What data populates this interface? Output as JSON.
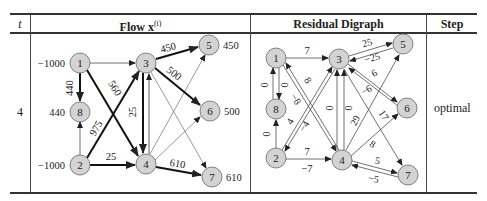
{
  "table": {
    "headers": {
      "t": "t",
      "flow": "Flow x",
      "flow_sup": "(t)",
      "residual": "Residual Digraph",
      "step": "Step"
    },
    "row": {
      "t": "4",
      "step": "optimal"
    }
  },
  "flow_graph": {
    "nodes": [
      {
        "id": "1",
        "supply": "−1000"
      },
      {
        "id": "2",
        "supply": "−1000"
      },
      {
        "id": "3",
        "supply": ""
      },
      {
        "id": "4",
        "supply": ""
      },
      {
        "id": "5",
        "supply": "450"
      },
      {
        "id": "6",
        "supply": "500"
      },
      {
        "id": "7",
        "supply": "610"
      },
      {
        "id": "8",
        "supply": "440"
      }
    ],
    "arc_labels": {
      "e18": "440",
      "e14": "560",
      "e23": "975",
      "e24": "25",
      "e34": "25",
      "e35": "450",
      "e36": "500",
      "e47": "610"
    }
  },
  "residual_graph": {
    "nodes": [
      "1",
      "2",
      "3",
      "4",
      "5",
      "6",
      "7",
      "8"
    ],
    "arc_labels": {
      "r13": "7",
      "r18a": "0",
      "r18b": "0",
      "r14": "8",
      "r41": "−8",
      "r23": "4",
      "r32": "−4",
      "r28": "0",
      "r24": "7",
      "r42": "−7",
      "r43a": "0",
      "r43b": "0",
      "r45": "29",
      "r35": "25",
      "r53": "−25",
      "r36": "6",
      "r63": "−6",
      "r37": "17",
      "r46": "8",
      "r47": "5",
      "r74": "−5"
    }
  },
  "colors": {
    "node_fill": "#d3d3d3",
    "node_stroke": "#666666",
    "rule": "#333333"
  }
}
